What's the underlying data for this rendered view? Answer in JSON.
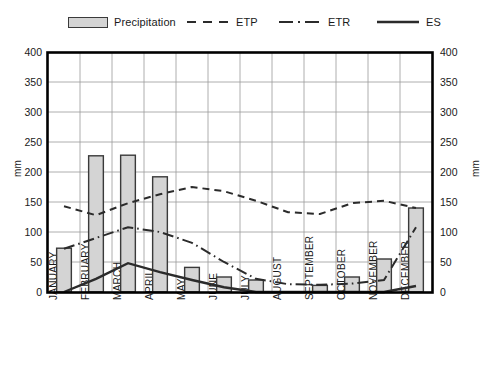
{
  "legend": {
    "items": [
      {
        "label": "Precipitation",
        "style": "bar",
        "icon": "bar-swatch-icon"
      },
      {
        "label": "ETP",
        "style": "dashed",
        "icon": "dashed-line-icon"
      },
      {
        "label": "ETR",
        "style": "dashdot",
        "icon": "dash-dot-line-icon"
      },
      {
        "label": "ES",
        "style": "solid",
        "icon": "solid-line-icon"
      }
    ]
  },
  "axes": {
    "y_left_label": "mm",
    "y_right_label": "mm",
    "y_ticks": [
      "400",
      "350",
      "300",
      "250",
      "200",
      "150",
      "100",
      "50",
      "0"
    ]
  },
  "colors": {
    "bar_fill": "#d4d4d4",
    "bar_stroke": "#3a3a3a",
    "line": "#2b2b2b",
    "grid": "#9a9a9a",
    "frame": "#000000",
    "background": "#ffffff"
  },
  "chart_data": {
    "type": "bar",
    "title": "",
    "subtitle": "",
    "xlabel": "",
    "ylabel": "mm",
    "ylim": [
      0,
      400
    ],
    "ytick_step": 50,
    "grid": true,
    "legend_position": "top",
    "categories": [
      "JANUARY",
      "FEBRUARY",
      "MARCH",
      "APRIL",
      "MAY",
      "JUNE",
      "JULY",
      "AUGUST",
      "SEPTEMBER",
      "OCTOBER",
      "NOVEMBER",
      "DECEMBER"
    ],
    "series": [
      {
        "name": "Precipitation",
        "type": "bar",
        "values": [
          73,
          227,
          228,
          192,
          41,
          25,
          20,
          0,
          11,
          25,
          55,
          140
        ]
      },
      {
        "name": "ETP",
        "type": "line",
        "style": "dashed",
        "values": [
          143,
          128,
          148,
          163,
          175,
          168,
          152,
          133,
          130,
          148,
          152,
          140
        ]
      },
      {
        "name": "ETR",
        "type": "line",
        "style": "dashdot",
        "values": [
          72,
          90,
          108,
          100,
          82,
          50,
          22,
          13,
          12,
          14,
          20,
          108
        ]
      },
      {
        "name": "ES",
        "type": "line",
        "style": "solid",
        "values": [
          0,
          22,
          48,
          33,
          20,
          8,
          0,
          0,
          0,
          0,
          0,
          10
        ]
      }
    ]
  }
}
